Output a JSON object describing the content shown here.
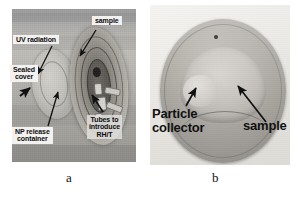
{
  "figure": {
    "panels": [
      {
        "id": "a",
        "caption": "a",
        "labels": [
          {
            "name": "uv-radiation",
            "text": "UV radiation"
          },
          {
            "name": "sealed-cover",
            "text": "Sealed\ncover"
          },
          {
            "name": "np-release",
            "text": "NP release\ncontainer"
          },
          {
            "name": "sample",
            "text": "sample"
          },
          {
            "name": "tubes-rh-t",
            "text": "Tubes to\nintroduce\nRH/T"
          }
        ]
      },
      {
        "id": "b",
        "caption": "b",
        "labels": [
          {
            "name": "particle-collector",
            "text": "Particle\ncollector"
          },
          {
            "name": "sample",
            "text": "sample"
          }
        ]
      }
    ],
    "colors": {
      "background": "#ffffff",
      "label_text": "#0d0d0d",
      "label_box": "#f2f1ef",
      "arrow": "#111111",
      "panel_a_base": "#b4b2ae",
      "panel_b_base": "#ecebe7"
    }
  }
}
